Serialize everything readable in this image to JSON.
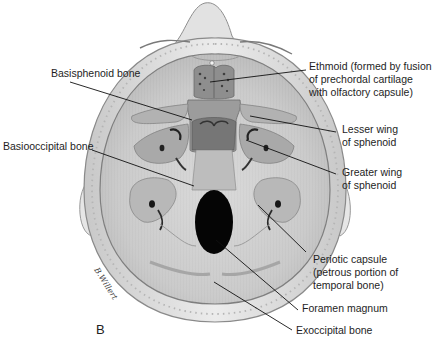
{
  "figure": {
    "panel_letter": "B",
    "signature": "B.Willert"
  },
  "labels": {
    "basisphenoid": {
      "lines": [
        "Basisphenoid bone"
      ]
    },
    "basioccipital": {
      "lines": [
        "Basiooccipital bone"
      ]
    },
    "ethmoid": {
      "lines": [
        "Ethmoid (formed by fusion",
        "of prechordal cartilage",
        "with olfactory capsule)"
      ]
    },
    "lesser_wing": {
      "lines": [
        "Lesser wing",
        "of sphenoid"
      ]
    },
    "greater_wing": {
      "lines": [
        "Greater wing",
        "of sphenoid"
      ]
    },
    "periotic": {
      "lines": [
        "Periotic capsule",
        "(petrous portion of",
        "temporal bone)"
      ]
    },
    "foramen_magnum": {
      "lines": [
        "Foramen magnum"
      ]
    },
    "exoccipital": {
      "lines": [
        "Exoccipital bone"
      ]
    }
  },
  "colors": {
    "skull_outer": "#e4e4e4",
    "skull_rim": "#d2d2d2",
    "cranial_floor": "#cfcfcf",
    "cartilage_dark": "#8e8e8e",
    "cartilage_mid": "#a8a8a8",
    "cartilage_light": "#bcbcbc",
    "foramen": "#050505",
    "leader_line": "#111111"
  }
}
